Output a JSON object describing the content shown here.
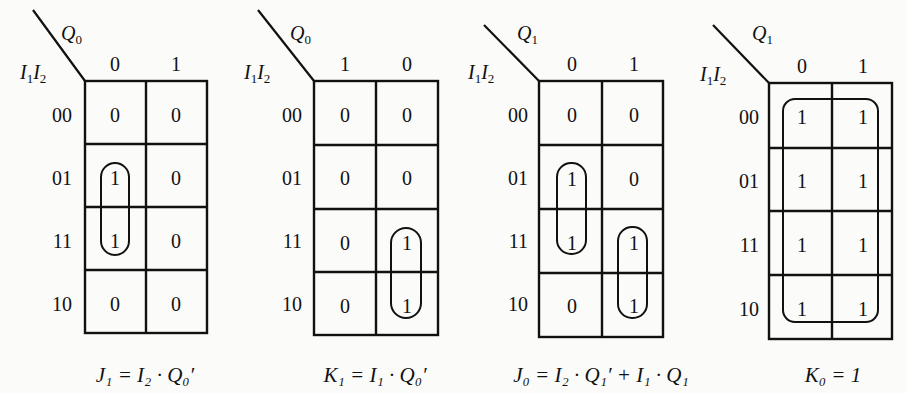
{
  "figure": {
    "kmaps": [
      {
        "id": "J1",
        "col_var": "Q",
        "col_sub": "0",
        "row_var_a": "I",
        "row_sub_a": "1",
        "row_var_b": "I",
        "row_sub_b": "2",
        "col_labels": [
          "0",
          "1"
        ],
        "row_labels": [
          "00",
          "01",
          "11",
          "10"
        ],
        "cells": [
          [
            "0",
            "0"
          ],
          [
            "1",
            "0"
          ],
          [
            "1",
            "0"
          ],
          [
            "0",
            "0"
          ]
        ],
        "equation": "J₁ = I₂ · Q₀′"
      },
      {
        "id": "K1",
        "col_var": "Q",
        "col_sub": "0",
        "row_var_a": "I",
        "row_sub_a": "1",
        "row_var_b": "I",
        "row_sub_b": "2",
        "col_labels": [
          "1",
          "0"
        ],
        "row_labels": [
          "00",
          "01",
          "11",
          "10"
        ],
        "cells": [
          [
            "0",
            "0"
          ],
          [
            "0",
            "0"
          ],
          [
            "0",
            "1"
          ],
          [
            "0",
            "1"
          ]
        ],
        "equation": "K₁ = I₁ · Q₀′"
      },
      {
        "id": "J0",
        "col_var": "Q",
        "col_sub": "1",
        "row_var_a": "I",
        "row_sub_a": "1",
        "row_var_b": "I",
        "row_sub_b": "2",
        "col_labels": [
          "0",
          "1"
        ],
        "row_labels": [
          "00",
          "01",
          "11",
          "10"
        ],
        "cells": [
          [
            "0",
            "0"
          ],
          [
            "1",
            "0"
          ],
          [
            "1",
            "1"
          ],
          [
            "0",
            "1"
          ]
        ],
        "equation": "J₀ = I₂ · Q₁′ + I₁ · Q₁"
      },
      {
        "id": "K0",
        "col_var": "Q",
        "col_sub": "1",
        "row_var_a": "I",
        "row_sub_a": "1",
        "row_var_b": "I",
        "row_sub_b": "2",
        "col_labels": [
          "0",
          "1"
        ],
        "row_labels": [
          "00",
          "01",
          "11",
          "10"
        ],
        "cells": [
          [
            "1",
            "1"
          ],
          [
            "1",
            "1"
          ],
          [
            "1",
            "1"
          ],
          [
            "1",
            "1"
          ]
        ],
        "equation": "K₀ = 1"
      }
    ]
  }
}
